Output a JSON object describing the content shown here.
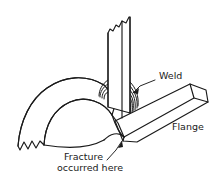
{
  "figure": {
    "background_color": "#ffffff",
    "line_color": "#1a1a1a",
    "width": 213,
    "height": 189
  },
  "labels": {
    "weld": "Weld",
    "flange": "Flange",
    "fracture_line1": "Fracture",
    "fracture_line2": "occurred here"
  },
  "parts": [
    {
      "name": "vertical-plate",
      "label": "Vertical plate",
      "description": "Upright plate with jagged torn top edge, welded at base"
    },
    {
      "name": "curved-pipe-band",
      "label": "Curved pipe band",
      "description": "Arched curved band with jagged fractured left end"
    },
    {
      "name": "flange-arm",
      "label": "Flange",
      "description": "Straight band angled up to the right from the weld junction"
    },
    {
      "name": "weld-bead",
      "label": "Weld",
      "description": "Concentric arc hatching at the plate-to-pipe joint"
    },
    {
      "name": "fracture-point",
      "label": "Fracture occurred here",
      "description": "Crack location at the base of the weld joint"
    }
  ],
  "leaders": [
    {
      "name": "weld-leader",
      "from_label": "Weld",
      "points_to": "weld-bead"
    },
    {
      "name": "fracture-leader",
      "from_label": "Fracture occurred here",
      "points_to": "fracture-point"
    }
  ]
}
